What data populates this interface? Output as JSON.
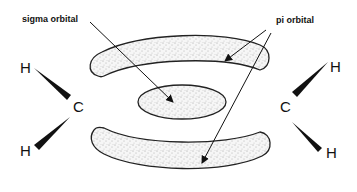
{
  "diagram": {
    "labels": {
      "sigma": "sigma orbital",
      "pi": "pi orbital"
    },
    "atoms": {
      "left_h_top": "H",
      "left_c": "C",
      "left_h_bottom": "H",
      "right_h_top": "H",
      "right_c": "C",
      "right_h_bottom": "H"
    },
    "colors": {
      "outline": "#222222",
      "stipple": "#555555",
      "fill": "#f4f4f4"
    }
  }
}
